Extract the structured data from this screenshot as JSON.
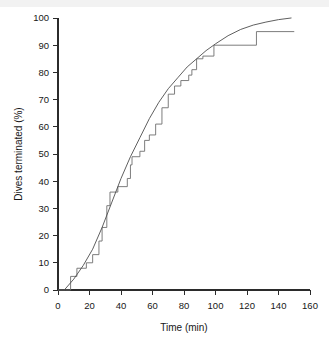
{
  "figure": {
    "background_color": "#ffffff",
    "line_color": "#4d4d4d",
    "step_color": "#6e6e6e",
    "axis_color": "#2b2b2b"
  },
  "chart_data": {
    "type": "line",
    "title": "",
    "subtitle": "",
    "xlabel": "Time (min)",
    "ylabel": "Dives terminated (%)",
    "xlim": [
      0,
      160
    ],
    "ylim": [
      0,
      100
    ],
    "xticks": [
      0,
      20,
      40,
      60,
      80,
      100,
      120,
      140,
      160
    ],
    "yticks": [
      0,
      10,
      20,
      30,
      40,
      50,
      60,
      70,
      80,
      90,
      100
    ],
    "xtick_labels": [
      "0",
      "20",
      "40",
      "60",
      "80",
      "100",
      "120",
      "140",
      "160"
    ],
    "ytick_labels": [
      "0",
      "10",
      "20",
      "30",
      "40",
      "50",
      "60",
      "70",
      "80",
      "90",
      "100"
    ],
    "grid": false,
    "legend": false,
    "legend_position": "none",
    "series": [
      {
        "name": "Observed cumulative dives terminated",
        "type": "step",
        "drawstyle": "steps-post",
        "x": [
          0,
          5,
          8,
          12,
          18,
          22,
          26,
          28,
          31,
          33,
          38,
          44,
          46,
          47,
          52,
          55,
          58,
          62,
          66,
          70,
          74,
          78,
          83,
          85,
          88,
          92,
          99,
          126,
          150
        ],
        "y": [
          0,
          0,
          5,
          8,
          10,
          13,
          18,
          23,
          31,
          36,
          38,
          41,
          46,
          49,
          51,
          55,
          57,
          61,
          67,
          72,
          75,
          77,
          79,
          81,
          85,
          86,
          90,
          95,
          95
        ]
      },
      {
        "name": "Fitted cumulative curve",
        "type": "line",
        "x": [
          4,
          10,
          16,
          22,
          28,
          34,
          40,
          46,
          52,
          58,
          64,
          70,
          76,
          82,
          88,
          94,
          100,
          108,
          116,
          124,
          132,
          140,
          148
        ],
        "y": [
          0,
          4,
          9,
          15,
          23,
          32,
          41,
          49,
          56,
          63,
          69,
          74,
          78,
          82,
          85,
          88,
          90.5,
          93.5,
          95.8,
          97.4,
          98.5,
          99.4,
          100
        ]
      }
    ]
  }
}
